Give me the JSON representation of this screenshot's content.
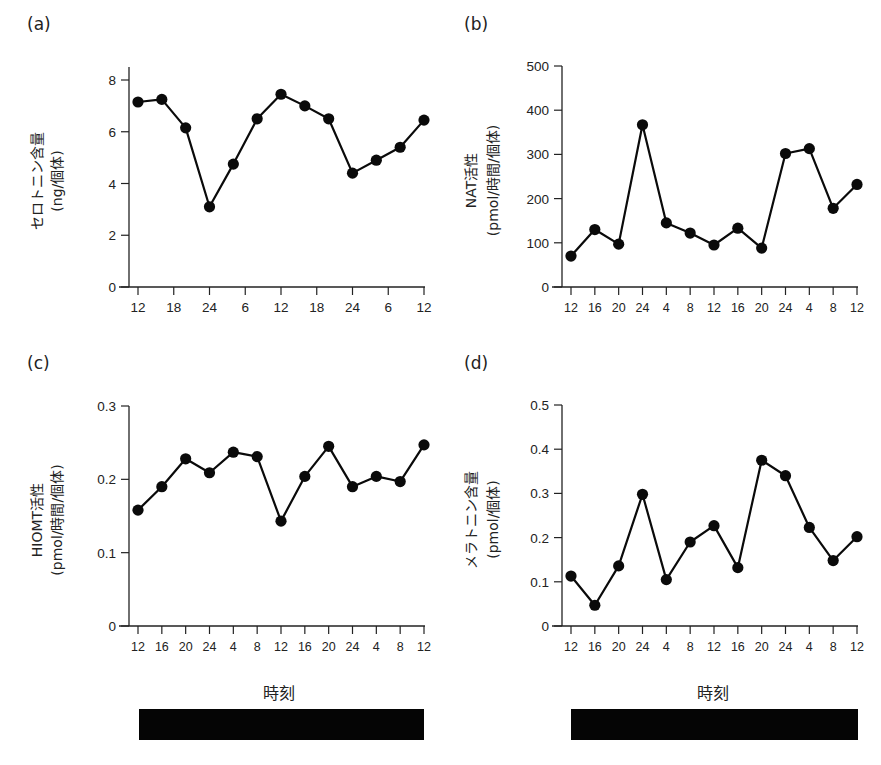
{
  "figure": {
    "panels": [
      {
        "id": "a",
        "label": "(a)",
        "ylabel_main": "セロトニン含量",
        "ylabel_unit": "(ng/個体)"
      },
      {
        "id": "b",
        "label": "(b)",
        "ylabel_main": "NAT活性",
        "ylabel_unit": "(pmol/時間/個体)"
      },
      {
        "id": "c",
        "label": "(c)",
        "ylabel_main": "HIOMT活性",
        "ylabel_unit": "(pmol/時間/個体)"
      },
      {
        "id": "d",
        "label": "(d)",
        "ylabel_main": "メラトニン含量",
        "ylabel_unit": "(pmol/個体)"
      }
    ],
    "xlabel": "時刻",
    "dark_bar_color": "#050505"
  },
  "chart_data": [
    {
      "id": "a",
      "type": "line",
      "title": "(a)",
      "xlabel": "",
      "ylabel": "セロトニン含量 (ng/個体)",
      "x_tick_labels": [
        "12",
        "18",
        "24",
        "6",
        "12",
        "18",
        "24",
        "6",
        "12"
      ],
      "x": [
        12,
        16,
        20,
        24,
        4,
        8,
        12,
        16,
        20,
        24,
        4,
        8,
        12
      ],
      "values": [
        7.15,
        7.25,
        6.15,
        3.1,
        4.75,
        6.5,
        7.45,
        7.0,
        6.5,
        4.4,
        4.9,
        5.4,
        6.45
      ],
      "y_ticks": [
        0,
        2,
        4,
        6,
        8
      ],
      "ylim": [
        0,
        8.5
      ],
      "grid": false,
      "marker": "filled-circle"
    },
    {
      "id": "b",
      "type": "line",
      "title": "(b)",
      "xlabel": "",
      "ylabel": "NAT活性 (pmol/時間/個体)",
      "x_tick_labels": [
        "12",
        "16",
        "20",
        "24",
        "4",
        "8",
        "12",
        "16",
        "20",
        "24",
        "4",
        "8",
        "12"
      ],
      "values": [
        70,
        130,
        97,
        367,
        145,
        122,
        95,
        133,
        88,
        302,
        313,
        178,
        232
      ],
      "y_ticks": [
        0,
        100,
        200,
        300,
        400,
        500
      ],
      "ylim": [
        0,
        500
      ],
      "grid": false,
      "marker": "filled-circle"
    },
    {
      "id": "c",
      "type": "line",
      "title": "(c)",
      "xlabel": "時刻",
      "ylabel": "HIOMT活性 (pmol/時間/個体)",
      "x_tick_labels": [
        "12",
        "16",
        "20",
        "24",
        "4",
        "8",
        "12",
        "16",
        "20",
        "24",
        "4",
        "8",
        "12"
      ],
      "values": [
        0.158,
        0.19,
        0.228,
        0.209,
        0.237,
        0.231,
        0.143,
        0.204,
        0.245,
        0.19,
        0.204,
        0.197,
        0.247
      ],
      "y_ticks": [
        0,
        0.1,
        0.2,
        0.3
      ],
      "y_tick_labels": [
        "0",
        "0.1",
        "0.2",
        "0.3"
      ],
      "ylim": [
        0,
        0.3
      ],
      "grid": false,
      "marker": "filled-circle"
    },
    {
      "id": "d",
      "type": "line",
      "title": "(d)",
      "xlabel": "時刻",
      "ylabel": "メラトニン含量 (pmol/個体)",
      "x_tick_labels": [
        "12",
        "16",
        "20",
        "24",
        "4",
        "8",
        "12",
        "16",
        "20",
        "24",
        "4",
        "8",
        "12"
      ],
      "values": [
        0.113,
        0.047,
        0.136,
        0.298,
        0.105,
        0.19,
        0.227,
        0.132,
        0.375,
        0.34,
        0.223,
        0.148,
        0.202
      ],
      "y_ticks": [
        0,
        0.1,
        0.2,
        0.3,
        0.4,
        0.5
      ],
      "y_tick_labels": [
        "0",
        "0.1",
        "0.2",
        "0.3",
        "0.4",
        "0.5"
      ],
      "ylim": [
        0,
        0.5
      ],
      "grid": false,
      "marker": "filled-circle"
    }
  ]
}
